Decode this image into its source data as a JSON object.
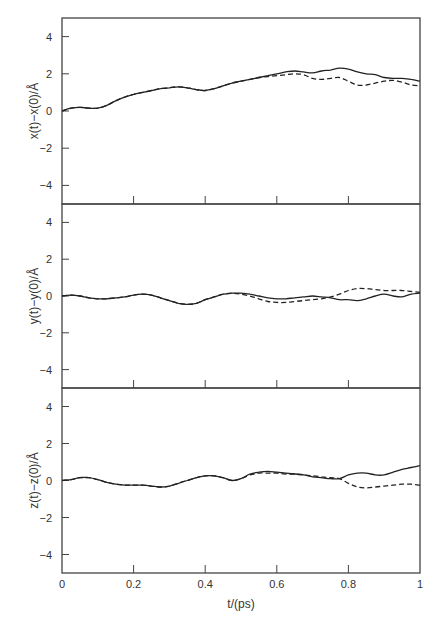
{
  "chart_data": {
    "type": "line",
    "title": "",
    "layout": "three vertically stacked panels sharing x-axis",
    "xlabel": "t/(ps)",
    "xlim": [
      0,
      1
    ],
    "x_ticks": [
      "0",
      "0.2",
      "0.4",
      "0.6",
      "0.8",
      "1"
    ],
    "grid": false,
    "legend": null,
    "series_styles": {
      "solid": "trajectory A (solid)",
      "dashed": "trajectory B (dashed)"
    },
    "x": [
      0,
      0.025,
      0.05,
      0.075,
      0.1,
      0.125,
      0.15,
      0.175,
      0.2,
      0.225,
      0.25,
      0.275,
      0.3,
      0.325,
      0.35,
      0.375,
      0.4,
      0.425,
      0.45,
      0.475,
      0.5,
      0.525,
      0.55,
      0.575,
      0.6,
      0.625,
      0.65,
      0.675,
      0.7,
      0.725,
      0.75,
      0.775,
      0.8,
      0.825,
      0.85,
      0.875,
      0.9,
      0.925,
      0.95,
      0.975,
      1.0
    ],
    "panels": [
      {
        "ylabel": "x(t)−x(0)/Å",
        "ylim": [
          -5,
          5
        ],
        "y_ticks": [
          "4",
          "2",
          "0",
          "−2",
          "−4"
        ],
        "series": [
          {
            "name": "solid",
            "values": [
              0.0,
              0.15,
              0.2,
              0.15,
              0.15,
              0.3,
              0.55,
              0.75,
              0.9,
              1.0,
              1.1,
              1.2,
              1.25,
              1.3,
              1.25,
              1.15,
              1.1,
              1.2,
              1.35,
              1.5,
              1.6,
              1.7,
              1.8,
              1.9,
              2.0,
              2.1,
              2.15,
              2.1,
              2.05,
              2.15,
              2.2,
              2.3,
              2.25,
              2.1,
              2.0,
              1.95,
              1.8,
              1.75,
              1.75,
              1.7,
              1.6
            ]
          },
          {
            "name": "dashed",
            "values": [
              0.0,
              0.15,
              0.2,
              0.15,
              0.15,
              0.3,
              0.55,
              0.75,
              0.9,
              1.0,
              1.1,
              1.2,
              1.25,
              1.3,
              1.25,
              1.15,
              1.1,
              1.2,
              1.35,
              1.5,
              1.6,
              1.7,
              1.8,
              1.85,
              1.9,
              1.95,
              2.0,
              1.95,
              1.75,
              1.7,
              1.75,
              1.8,
              1.6,
              1.4,
              1.4,
              1.5,
              1.6,
              1.65,
              1.55,
              1.4,
              1.35
            ]
          }
        ]
      },
      {
        "ylabel": "y(t)−y(0)/Å",
        "ylim": [
          -5,
          5
        ],
        "y_ticks": [
          "4",
          "2",
          "0",
          "−2",
          "−4"
        ],
        "series": [
          {
            "name": "solid",
            "values": [
              0.0,
              0.05,
              0.0,
              -0.1,
              -0.15,
              -0.15,
              -0.1,
              -0.05,
              0.05,
              0.1,
              0.05,
              -0.1,
              -0.25,
              -0.4,
              -0.45,
              -0.4,
              -0.2,
              -0.05,
              0.1,
              0.15,
              0.15,
              0.1,
              0.0,
              -0.1,
              -0.15,
              -0.15,
              -0.1,
              -0.05,
              0.0,
              -0.05,
              -0.1,
              -0.2,
              -0.2,
              -0.25,
              -0.15,
              0.0,
              0.1,
              0.0,
              -0.05,
              0.1,
              0.15
            ]
          },
          {
            "name": "dashed",
            "values": [
              0.0,
              0.05,
              0.0,
              -0.1,
              -0.15,
              -0.15,
              -0.1,
              -0.05,
              0.05,
              0.1,
              0.05,
              -0.1,
              -0.25,
              -0.4,
              -0.45,
              -0.4,
              -0.2,
              -0.05,
              0.1,
              0.15,
              0.1,
              0.0,
              -0.15,
              -0.3,
              -0.35,
              -0.35,
              -0.3,
              -0.25,
              -0.2,
              -0.15,
              -0.05,
              0.1,
              0.3,
              0.4,
              0.4,
              0.35,
              0.3,
              0.3,
              0.3,
              0.25,
              0.2
            ]
          }
        ]
      },
      {
        "ylabel": "z(t)−z(0)/Å",
        "ylim": [
          -5,
          5
        ],
        "y_ticks": [
          "4",
          "2",
          "0",
          "−2",
          "−4"
        ],
        "series": [
          {
            "name": "solid",
            "values": [
              0.0,
              0.05,
              0.15,
              0.15,
              0.05,
              -0.1,
              -0.2,
              -0.25,
              -0.25,
              -0.25,
              -0.3,
              -0.35,
              -0.3,
              -0.15,
              0.0,
              0.15,
              0.25,
              0.25,
              0.15,
              0.0,
              0.1,
              0.35,
              0.45,
              0.5,
              0.45,
              0.4,
              0.35,
              0.3,
              0.2,
              0.15,
              0.1,
              0.1,
              0.3,
              0.4,
              0.4,
              0.3,
              0.3,
              0.45,
              0.6,
              0.7,
              0.8
            ]
          },
          {
            "name": "dashed",
            "values": [
              0.0,
              0.05,
              0.15,
              0.15,
              0.05,
              -0.1,
              -0.2,
              -0.25,
              -0.25,
              -0.25,
              -0.3,
              -0.35,
              -0.3,
              -0.15,
              0.0,
              0.15,
              0.25,
              0.25,
              0.15,
              0.0,
              0.1,
              0.3,
              0.4,
              0.4,
              0.4,
              0.35,
              0.35,
              0.3,
              0.25,
              0.2,
              0.15,
              0.1,
              -0.15,
              -0.35,
              -0.4,
              -0.35,
              -0.3,
              -0.25,
              -0.2,
              -0.2,
              -0.25
            ]
          }
        ]
      }
    ]
  }
}
